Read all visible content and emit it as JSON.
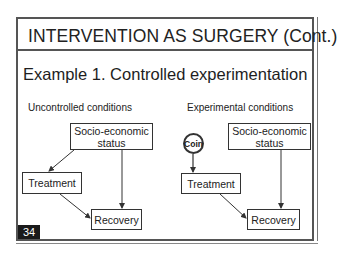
{
  "slide": {
    "title": "INTERVENTION AS SURGERY (Cont.)",
    "heading": "Example 1.  Controlled experimentation",
    "page_number": "34"
  },
  "left_diagram": {
    "subtitle": "Uncontrolled conditions",
    "nodes": {
      "ses_line1": "Socio-economic",
      "ses_line2": "status",
      "treatment": "Treatment",
      "recovery": "Recovery"
    },
    "edges": [
      {
        "from": "Socio-economic status",
        "to": "Treatment"
      },
      {
        "from": "Socio-economic status",
        "to": "Recovery"
      },
      {
        "from": "Treatment",
        "to": "Recovery"
      }
    ]
  },
  "right_diagram": {
    "subtitle": "Experimental conditions",
    "nodes": {
      "coin": "Coin",
      "ses_line1": "Socio-economic",
      "ses_line2": "status",
      "treatment": "Treatment",
      "recovery": "Recovery"
    },
    "edges": [
      {
        "from": "Coin",
        "to": "Treatment"
      },
      {
        "from": "Socio-economic status",
        "to": "Recovery"
      },
      {
        "from": "Treatment",
        "to": "Recovery"
      }
    ]
  },
  "colors": {
    "frame": "#555555",
    "line": "#333333",
    "badge_bg": "#1a1a1a",
    "badge_text": "#ffffff"
  }
}
